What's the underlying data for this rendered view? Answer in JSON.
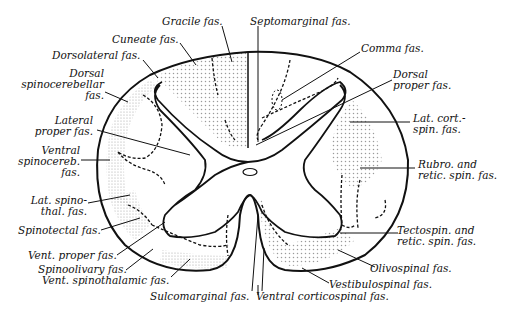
{
  "figure": {
    "colors": {
      "ink": "#111111",
      "stipple": "#9a9a9a",
      "background": "#ffffff"
    }
  },
  "labels": {
    "gracile": "Gracile fas.",
    "septomarginal": "Septomarginal fas.",
    "cuneate": "Cuneate fas.",
    "comma": "Comma fas.",
    "dorsolateral": "Dorsolateral fas.",
    "dorsal_proper_1": "Dorsal",
    "dorsal_proper_2": "proper fas.",
    "dorsal_spinocerebellar_1": "Dorsal",
    "dorsal_spinocerebellar_2": "spinocerebellar",
    "dorsal_spinocerebellar_3": "fas.",
    "lat_cort_spin_1": "Lat. cort.-",
    "lat_cort_spin_2": "spin. fas.",
    "lateral_proper_1": "Lateral",
    "lateral_proper_2": "proper fas.",
    "ventral_spinocereb_1": "Ventral",
    "ventral_spinocereb_2": "spinocereb.",
    "ventral_spinocereb_3": "fas.",
    "rubro_retic_1": "Rubro. and",
    "rubro_retic_2": "retic. spin. fas.",
    "lat_spinothal_1": "Lat. spino-",
    "lat_spinothal_2": "thal. fas.",
    "spinotectal": "Spinotectal fas.",
    "tectospin_1": "Tectospin. and",
    "tectospin_2": "retic. spin. fas.",
    "vent_proper": "Vent. proper fas.",
    "olivospinal": "Olivospinal fas.",
    "spinoolivary": "Spinoolivary fas.",
    "vent_spinothalamic": "Vent. spinothalamic fas.",
    "vestibulospinal": "Vestibulospinal fas.",
    "sulcomarginal": "Sulcomarginal fas.",
    "ventral_corticospinal": "Ventral corticospinal fas."
  }
}
